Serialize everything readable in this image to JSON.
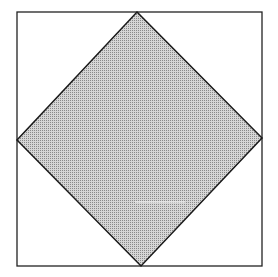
{
  "diagram": {
    "outer_square": {
      "x1": 17,
      "y1": 12,
      "x2": 262,
      "y2": 266,
      "stroke": "#222222",
      "fill": "#ffffff"
    },
    "inner_diamond": {
      "points": [
        [
          137,
          12
        ],
        [
          262,
          138
        ],
        [
          141,
          266
        ],
        [
          17,
          140
        ]
      ],
      "stroke": "#1a1a1a",
      "fill": "#b8b8b8",
      "pattern": "fine-dot-grid"
    }
  }
}
